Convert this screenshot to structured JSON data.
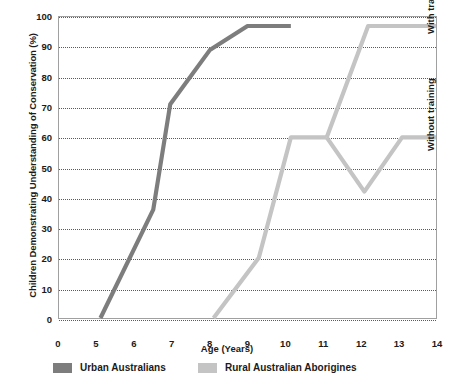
{
  "chart_data": {
    "type": "line",
    "title": "",
    "xlabel": "Age (Years)",
    "ylabel": "Children Demonstrating Understanding of Conservation (%)",
    "xlim": [
      0,
      14
    ],
    "ylim": [
      0,
      100
    ],
    "grid": true,
    "legend_position": "bottom",
    "x_tick_labels": [
      "0",
      "5",
      "6",
      "7",
      "8",
      "9",
      "10",
      "11",
      "12",
      "13",
      "14"
    ],
    "x_tick_values": [
      0,
      5,
      6,
      7,
      8,
      9,
      10,
      11,
      12,
      13,
      14
    ],
    "y_tick_labels": [
      "0",
      "10",
      "20",
      "30",
      "40",
      "50",
      "60",
      "70",
      "80",
      "90",
      "100"
    ],
    "y_tick_values": [
      0,
      10,
      20,
      30,
      40,
      50,
      60,
      70,
      80,
      90,
      100
    ],
    "series": [
      {
        "name": "Urban Australians",
        "color": "#7d7d7d",
        "points": [
          {
            "x": 5.1,
            "y": 0
          },
          {
            "x": 6.5,
            "y": 36
          },
          {
            "x": 6.95,
            "y": 71
          },
          {
            "x": 8.0,
            "y": 89
          },
          {
            "x": 9.0,
            "y": 97
          },
          {
            "x": 10.15,
            "y": 97
          }
        ]
      },
      {
        "name": "Rural Australian Aborigines",
        "color": "#c4c4c4",
        "points": [
          {
            "x": 8.1,
            "y": 0
          },
          {
            "x": 9.3,
            "y": 20
          },
          {
            "x": 10.15,
            "y": 60
          },
          {
            "x": 11.1,
            "y": 60
          }
        ]
      },
      {
        "name": "Rural Australian Aborigines (with training)",
        "color": "#c4c4c4",
        "points": [
          {
            "x": 11.1,
            "y": 60
          },
          {
            "x": 12.2,
            "y": 97
          },
          {
            "x": 14.0,
            "y": 97
          }
        ]
      },
      {
        "name": "Rural Australian Aborigines (without training)",
        "color": "#c4c4c4",
        "points": [
          {
            "x": 11.1,
            "y": 60
          },
          {
            "x": 12.1,
            "y": 42
          },
          {
            "x": 13.1,
            "y": 60
          },
          {
            "x": 14.0,
            "y": 60
          }
        ]
      }
    ],
    "annotations": [
      {
        "text": "With training",
        "position": "right-upper"
      },
      {
        "text": "Without training",
        "position": "right-lower"
      }
    ]
  },
  "legend": {
    "items": [
      {
        "label": "Urban Australians",
        "color": "#7d7d7d"
      },
      {
        "label": "Rural Australian Aborigines",
        "color": "#c4c4c4"
      }
    ]
  },
  "axes": {
    "x_title": "Age (Years)",
    "y_title": "Children Demonstrating Understanding of Conservation (%)"
  },
  "annotations": {
    "with_training": "With training",
    "without_training": "Without training"
  },
  "colors": {
    "urban": "#7d7d7d",
    "rural": "#c4c4c4",
    "grid": "#5a5a5a",
    "frame": "#a0a0a0",
    "text": "#1b1b1b"
  }
}
